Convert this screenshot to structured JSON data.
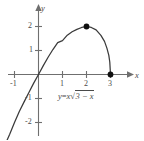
{
  "chart_data": {
    "type": "line",
    "title": "",
    "equation_label": "y = x√(3 − x)",
    "equation_parts": {
      "lhs": "y",
      "equals": "=",
      "coefficient": "x",
      "radical_sign": "√",
      "radicand": "3 − x"
    },
    "xlabel": "x",
    "ylabel": "y",
    "xlim": [
      -1.6,
      4.1
    ],
    "ylim": [
      -2.8,
      2.6
    ],
    "grid": false,
    "legend": "none",
    "x_ticks": [
      -1,
      1,
      2,
      3
    ],
    "x_tick_labels": [
      "-1",
      "1",
      "2",
      "3"
    ],
    "y_ticks": [
      2,
      1,
      -1,
      -2
    ],
    "y_tick_labels": [
      "2",
      "1",
      "-1",
      "-2"
    ],
    "series": [
      {
        "name": "y = x sqrt(3 - x)",
        "color": "#3a3a3a",
        "x": [
          -1.55,
          -1.4,
          -1.2,
          -1.0,
          -0.8,
          -0.6,
          -0.4,
          -0.2,
          0.0,
          0.2,
          0.4,
          0.6,
          0.8,
          1.0,
          1.2,
          1.4,
          1.6,
          1.8,
          2.0,
          2.2,
          2.4,
          2.6,
          2.75,
          2.85,
          2.93,
          2.97,
          3.0
        ],
        "y": [
          -3.31,
          -2.94,
          -2.49,
          -2.0,
          -1.54,
          -1.14,
          -0.75,
          -0.36,
          0.0,
          0.37,
          0.72,
          1.04,
          1.33,
          1.41,
          1.64,
          1.78,
          1.88,
          1.96,
          2.0,
          1.96,
          1.86,
          1.63,
          1.38,
          1.1,
          0.8,
          0.52,
          0.0
        ]
      }
    ],
    "points": [
      {
        "name": "maximum-point",
        "x": 2,
        "y": 2
      },
      {
        "name": "x-intercept-point",
        "x": 3,
        "y": 0
      }
    ],
    "axis_color": "#6f6f6f",
    "curve_color": "#3a3a3a",
    "point_color": "#111111",
    "background_color": "#ffffff"
  }
}
